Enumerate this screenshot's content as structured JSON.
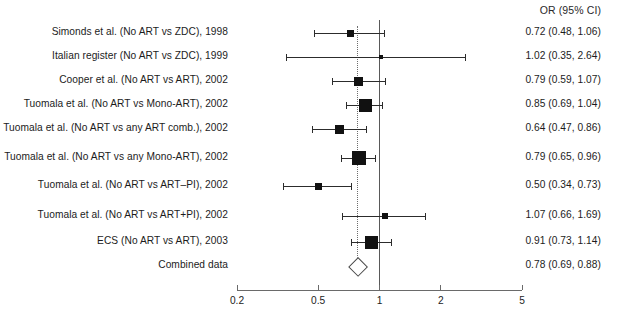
{
  "figure": {
    "title": "",
    "background_color": "#ffffff",
    "marker_color": "#111111",
    "line_color": "#2c2c2c",
    "axis_color": "#6a6a6a",
    "null_line_color": "#595959",
    "pooled_line_color": "#6d6d6d",
    "diamond_fill": "#ffffff"
  },
  "columns": {
    "study_header": "",
    "estimate_header": "OR (95% CI)"
  },
  "chart_data": {
    "type": "forest",
    "title": "",
    "xlabel": "",
    "ylabel": "",
    "xscale": "log",
    "xlim": [
      0.2,
      5
    ],
    "ticks": [
      "0.2",
      "0.5",
      "1",
      "2",
      "5"
    ],
    "tick_values": [
      0.2,
      0.5,
      1,
      2,
      5
    ],
    "grid": false,
    "null_value": 1,
    "pooled_reference": 0.78,
    "categories": [
      "Simonds et al. (No ART vs ZDC), 1998",
      "Italian register (No ART vs ZDC), 1999",
      "Cooper et al. (No ART vs ART), 2002",
      "Tuomala et al. (No ART vs Mono-ART), 2002",
      "Tuomala et al. (No ART vs any ART comb.), 2002",
      "Tuomala et al. (No ART vs any Mono-ART), 2002",
      "Tuomala et al. (No ART vs ART–PI), 2002",
      "Tuomala et al. (No ART vs ART+PI), 2002",
      "ECS (No ART vs ART), 2003",
      "Combined data"
    ],
    "values": [
      0.72,
      1.02,
      0.79,
      0.85,
      0.64,
      0.79,
      0.5,
      1.07,
      0.91,
      0.78
    ],
    "ci_lower": [
      0.48,
      0.35,
      0.59,
      0.69,
      0.47,
      0.65,
      0.34,
      0.66,
      0.73,
      0.69
    ],
    "ci_upper": [
      1.06,
      2.64,
      1.07,
      1.04,
      0.86,
      0.96,
      0.73,
      1.69,
      1.14,
      0.88
    ],
    "labels": [
      "0.72 (0.48, 1.06)",
      "1.02 (0.35, 2.64)",
      "0.79 (0.59, 1.07)",
      "0.85 (0.69, 1.04)",
      "0.64 (0.47, 0.86)",
      "0.79 (0.65, 0.96)",
      "0.50 (0.34, 0.73)",
      "1.07 (0.66, 1.69)",
      "0.91 (0.73, 1.14)",
      "0.78 (0.69, 0.88)"
    ],
    "marker_sizes": [
      7,
      4,
      9,
      13,
      9,
      14,
      7,
      6,
      13,
      0
    ],
    "is_summary": [
      false,
      false,
      false,
      false,
      false,
      false,
      false,
      false,
      false,
      true
    ]
  },
  "rows": [
    {
      "label": "Simonds et al. (No ART vs ZDC), 1998",
      "estimate": "0.72 (0.48, 1.06)"
    },
    {
      "label": "Italian register (No ART vs ZDC), 1999",
      "estimate": "1.02 (0.35, 2.64)"
    },
    {
      "label": "Cooper et al. (No ART vs ART), 2002",
      "estimate": "0.79 (0.59, 1.07)"
    },
    {
      "label": "Tuomala et al. (No ART vs Mono-ART), 2002",
      "estimate": "0.85 (0.69, 1.04)"
    },
    {
      "label": "Tuomala et al. (No ART vs any ART comb.), 2002",
      "estimate": "0.64 (0.47, 0.86)"
    },
    {
      "label": "Tuomala et al. (No ART vs any Mono-ART), 2002",
      "estimate": "0.79 (0.65, 0.96)"
    },
    {
      "label": "Tuomala et al. (No ART vs ART–PI), 2002",
      "estimate": "0.50 (0.34, 0.73)"
    },
    {
      "label": "Tuomala et al. (No ART vs ART+PI), 2002",
      "estimate": "1.07 (0.66, 1.69)"
    },
    {
      "label": "ECS (No ART vs ART), 2003",
      "estimate": "0.91 (0.73, 1.14)"
    },
    {
      "label": "Combined data",
      "estimate": "0.78 (0.69, 0.88)"
    }
  ],
  "axis": {
    "tick_labels": [
      "0.2",
      "0.5",
      "1",
      "2",
      "5"
    ]
  },
  "geometry": {
    "x_left_px": 237,
    "x_right_px": 522,
    "x_left_value": 0.2,
    "x_right_value": 5,
    "row_y_px": [
      33,
      57,
      81,
      105,
      129,
      158,
      186,
      216,
      242,
      266
    ],
    "axis_y_px": 290,
    "tick_label_y_px": 295,
    "tick_len_px": 5,
    "null_line_top_px": 20,
    "null_line_bottom_px": 291,
    "pooled_line_top_px": 26,
    "pooled_line_bottom_px": 258
  }
}
